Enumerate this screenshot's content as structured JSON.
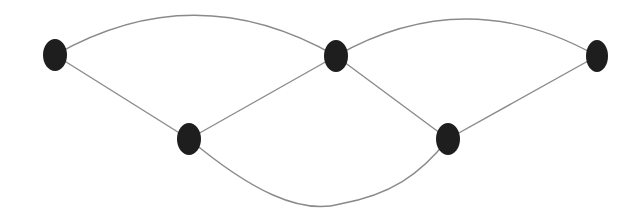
{
  "diagram": {
    "type": "graph",
    "title": "",
    "node_color": "#1e1e1e",
    "edge_color": "#8a8a8a",
    "background": "#ffffff",
    "nodes": [
      {
        "id": "n1",
        "label": "",
        "cx": 55,
        "cy": 55,
        "rx": 12,
        "ry": 16
      },
      {
        "id": "n2",
        "label": "",
        "cx": 336,
        "cy": 56,
        "rx": 12,
        "ry": 16
      },
      {
        "id": "n3",
        "label": "",
        "cx": 597,
        "cy": 56,
        "rx": 11,
        "ry": 16
      },
      {
        "id": "n4",
        "label": "",
        "cx": 189,
        "cy": 139,
        "rx": 12,
        "ry": 16
      },
      {
        "id": "n5",
        "label": "",
        "cx": 448,
        "cy": 139,
        "rx": 12,
        "ry": 16
      }
    ],
    "edges": [
      {
        "id": "e1",
        "from": "n1",
        "to": "n2",
        "shape": "arc-up",
        "d": "M 55 55 Q 195 -25 336 56"
      },
      {
        "id": "e2",
        "from": "n2",
        "to": "n3",
        "shape": "arc-up",
        "d": "M 336 56 Q 466 -18 597 56"
      },
      {
        "id": "e3",
        "from": "n1",
        "to": "n4",
        "shape": "line",
        "d": "M 55 55 L 189 139"
      },
      {
        "id": "e4",
        "from": "n4",
        "to": "n2",
        "shape": "line",
        "d": "M 189 139 L 336 56"
      },
      {
        "id": "e5",
        "from": "n2",
        "to": "n5",
        "shape": "line",
        "d": "M 336 56 L 448 139"
      },
      {
        "id": "e6",
        "from": "n5",
        "to": "n3",
        "shape": "line",
        "d": "M 448 139 L 597 56"
      },
      {
        "id": "e7",
        "from": "n4",
        "to": "n5",
        "shape": "curve-down",
        "d": "M 189 139 C 250 190 300 215 340 204 C 390 195 420 175 448 139"
      }
    ]
  }
}
